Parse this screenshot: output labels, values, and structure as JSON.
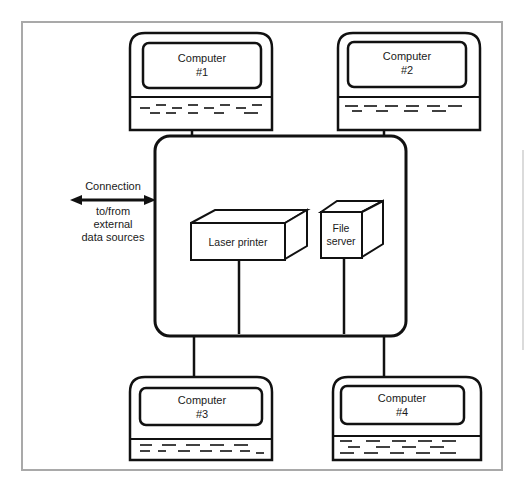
{
  "diagram": {
    "type": "network-topology",
    "frame_color": "#a9a9a9",
    "stroke_color": "#111111",
    "computers": [
      {
        "id": "computer-1",
        "line1": "Computer",
        "line2": "#1"
      },
      {
        "id": "computer-2",
        "line1": "Computer",
        "line2": "#2"
      },
      {
        "id": "computer-3",
        "line1": "Computer",
        "line2": "#3"
      },
      {
        "id": "computer-4",
        "line1": "Computer",
        "line2": "#4"
      }
    ],
    "hub": {
      "label": ""
    },
    "devices": {
      "laser_printer": {
        "label": "Laser printer"
      },
      "file_server": {
        "line1": "File",
        "line2": "server"
      }
    },
    "connection": {
      "label_top": "Connection",
      "label_line2": "to/from",
      "label_line3": "external",
      "label_line4": "data sources",
      "direction": "bidirectional"
    }
  }
}
